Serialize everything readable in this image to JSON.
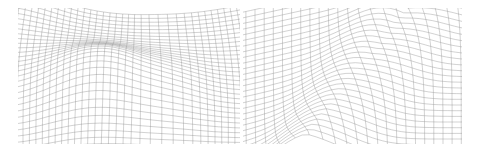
{
  "figure": {
    "background": "#ffffff",
    "line_color": "#8a8a8a",
    "panels": [
      {
        "name": "left-warped-mesh",
        "box": {
          "x": 18,
          "y": 8,
          "w": 222,
          "h": 136
        },
        "grid": {
          "u": 46,
          "v": 34
        },
        "warp": "saddle-fold"
      },
      {
        "name": "right-warped-mesh",
        "box": {
          "x": 243,
          "y": 8,
          "w": 219,
          "h": 136
        },
        "grid": {
          "u": 30,
          "v": 30
        },
        "warp": "diagonal-ridge"
      }
    ]
  }
}
